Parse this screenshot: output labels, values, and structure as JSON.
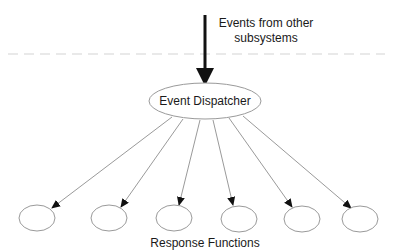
{
  "diagram": {
    "input_label_line1": "Events from other",
    "input_label_line2": "subsystems",
    "dispatcher_label": "Event Dispatcher",
    "response_label": "Response Functions",
    "response_nodes": [
      {
        "cx": 37,
        "cy": 218
      },
      {
        "cx": 109,
        "cy": 218
      },
      {
        "cx": 174,
        "cy": 218
      },
      {
        "cx": 239,
        "cy": 219
      },
      {
        "cx": 302,
        "cy": 219
      },
      {
        "cx": 360,
        "cy": 219
      }
    ],
    "colors": {
      "stroke": "#9a9a9a",
      "arrow": "#111111",
      "text": "#1a1a1a",
      "dash": "#e2e2e2"
    }
  }
}
